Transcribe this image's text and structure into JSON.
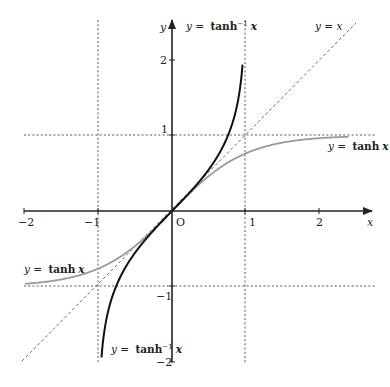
{
  "chart_data": {
    "type": "line",
    "title": "",
    "xlabel": "x",
    "ylabel": "y",
    "origin_label": "O",
    "xlim": [
      -2,
      2.6
    ],
    "ylim": [
      -2,
      2.5
    ],
    "x_ticks": [
      "-2",
      "-1",
      "1",
      "2"
    ],
    "y_ticks": [
      "2",
      "1",
      "-1",
      "-2"
    ],
    "asymptotes": {
      "vertical": [
        -1,
        1
      ],
      "horizontal": [
        -1,
        1
      ],
      "style": "dotted"
    },
    "series": [
      {
        "name": "y = tanh x",
        "function": "tanh(x)",
        "x_range": [
          -2,
          2.4
        ],
        "color": "#999999",
        "points": [
          [
            -2,
            -0.96
          ],
          [
            -1,
            -0.76
          ],
          [
            -0.5,
            -0.46
          ],
          [
            0,
            0
          ],
          [
            0.5,
            0.46
          ],
          [
            1,
            0.76
          ],
          [
            2,
            0.96
          ],
          [
            2.4,
            0.98
          ]
        ]
      },
      {
        "name": "y = tanh⁻¹ x",
        "function": "atanh(x)",
        "x_range": [
          -0.96,
          0.96
        ],
        "color": "#111111",
        "points": [
          [
            -0.96,
            -1.95
          ],
          [
            -0.5,
            -0.55
          ],
          [
            0,
            0
          ],
          [
            0.5,
            0.55
          ],
          [
            0.9,
            1.47
          ],
          [
            0.96,
            1.95
          ]
        ]
      },
      {
        "name": "y = x",
        "function": "x",
        "x_range": [
          -2,
          2.5
        ],
        "color": "#444444",
        "style": "dashed",
        "points": [
          [
            -2,
            -2
          ],
          [
            2.5,
            2.5
          ]
        ]
      }
    ],
    "annotations": [
      {
        "text": "y = tanh⁻¹ x",
        "position": "top, near x=1"
      },
      {
        "text": "y = x",
        "position": "top right"
      },
      {
        "text": "y = tanh x",
        "position": "right, below y=1"
      },
      {
        "text": "y = tanh x",
        "position": "left, above y=-1"
      },
      {
        "text": "y = tanh⁻¹ x",
        "position": "bottom, near x=-1"
      }
    ],
    "grid": false,
    "legend": "none (inline labels)"
  },
  "labels": {
    "x_axis": "x",
    "y_axis": "y",
    "origin": "O",
    "tick_x_neg2": "−2",
    "tick_x_neg1": "−1",
    "tick_x_1": "1",
    "tick_x_2": "2",
    "tick_y_2": "2",
    "tick_y_1": "1",
    "tick_y_neg1": "−1",
    "tick_y_neg2": "−2",
    "eq_prefix": "y =",
    "atanh_fn": "tanh",
    "atanh_sup": "−1",
    "tanh_fn": "tanh",
    "var": "x",
    "yx_label": "y = x"
  }
}
